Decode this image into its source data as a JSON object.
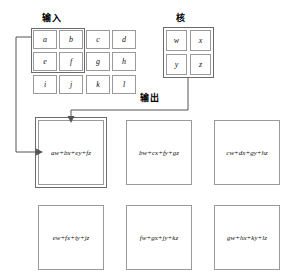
{
  "figure": {
    "labels": {
      "input": "输入",
      "kernel": "核",
      "output": "输出"
    }
  },
  "input_grid": {
    "rows": 3,
    "cols": 4,
    "cells": [
      [
        "a",
        "b",
        "c",
        "d"
      ],
      [
        "e",
        "f",
        "g",
        "h"
      ],
      [
        "i",
        "j",
        "k",
        "l"
      ]
    ],
    "highlight": [
      "a",
      "b",
      "e",
      "f"
    ]
  },
  "kernel_grid": {
    "rows": 2,
    "cols": 2,
    "cells": [
      [
        "w",
        "x"
      ],
      [
        "y",
        "z"
      ]
    ]
  },
  "output_grid": {
    "rows": 2,
    "cols": 3,
    "cells": [
      [
        "aw+bx+ey+fz",
        "bw+cx+fy+gz",
        "cw+dx+gy+hz"
      ],
      [
        "ew+fx+iy+jz",
        "fw+gx+jy+kz",
        "gw+hx+ky+lz"
      ]
    ],
    "highlight_index": 0
  },
  "colors": {
    "cell_border": "#9a9a9a",
    "highlight_border": "#6b6b6b",
    "connector": "#555555",
    "background": "#ffffff",
    "text": "#111111"
  }
}
